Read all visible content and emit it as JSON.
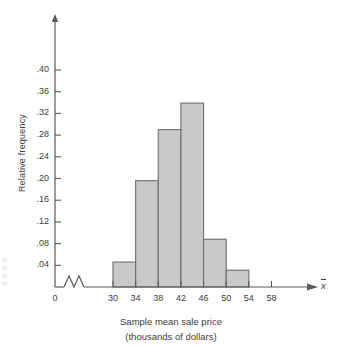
{
  "chart_data": {
    "type": "bar",
    "title": "",
    "subtitle": "",
    "xlabel": "Sample mean sale price",
    "xlabel_line2": "(thousands of dollars)",
    "ylabel": "Relative frequency",
    "x_variable_symbol": "x",
    "categories": [
      "30-34",
      "34-38",
      "38-42",
      "42-46",
      "46-50",
      "50-54"
    ],
    "bin_edges": [
      30,
      34,
      38,
      42,
      46,
      50,
      54
    ],
    "values": [
      0.046,
      0.196,
      0.29,
      0.339,
      0.088,
      0.031
    ],
    "xlim": [
      28,
      60
    ],
    "ylim": [
      0,
      0.42
    ],
    "x_ticks": [
      30,
      34,
      38,
      42,
      46,
      50,
      54,
      58
    ],
    "x_tick_labels": [
      "30",
      "34",
      "38",
      "42",
      "46",
      "50",
      "54",
      "58"
    ],
    "x_origin_label": "0",
    "y_ticks": [
      0.04,
      0.08,
      0.12,
      0.16,
      0.2,
      0.24,
      0.28,
      0.32,
      0.36,
      0.4
    ],
    "y_tick_labels": [
      ".04",
      ".08",
      ".12",
      ".16",
      ".20",
      ".24",
      ".28",
      ".32",
      ".36",
      ".40"
    ],
    "grid": false,
    "legend": "none",
    "axis_break": true,
    "bar_fill_color": "#c9c9c9",
    "bar_edge_color": "#6e6e6e",
    "axis_color": "#5a5a5a"
  },
  "margin_scrap_text": "0 0 0 0"
}
